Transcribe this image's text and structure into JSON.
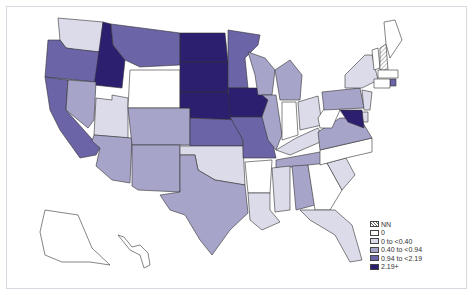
{
  "map": {
    "title": "",
    "colors": {
      "NN": "#ffffff",
      "zero": "#ffffff",
      "c1": "#dcdbe9",
      "c2": "#a7a4c9",
      "c3": "#6b64a6",
      "c4": "#2d1f70"
    },
    "legend": [
      {
        "key": "NN",
        "label": "NN",
        "color": "#ffffff",
        "hatched": true
      },
      {
        "key": "zero",
        "label": "0",
        "color": "#ffffff"
      },
      {
        "key": "c1",
        "label": "0 to <0.40",
        "color": "#dcdbe9"
      },
      {
        "key": "c2",
        "label": "0.40 to <0.94",
        "color": "#a7a4c9"
      },
      {
        "key": "c3",
        "label": "0.94 to <2.19",
        "color": "#6b64a6"
      },
      {
        "key": "c4",
        "label": "2.19+",
        "color": "#2d1f70"
      }
    ],
    "states": {
      "WA": "c1",
      "OR": "c3",
      "CA": "c3",
      "ID": "c4",
      "NV": "c2",
      "UT": "c1",
      "AZ": "c2",
      "MT": "c3",
      "WY": "zero",
      "CO": "c2",
      "NM": "c2",
      "ND": "c4",
      "SD": "c4",
      "NE": "c4",
      "KS": "c3",
      "OK": "c1",
      "TX": "c2",
      "MN": "c3",
      "IA": "c4",
      "MO": "c3",
      "AR": "zero",
      "LA": "c1",
      "WI": "c2",
      "IL": "c2",
      "MI": "c2",
      "IN": "zero",
      "OH": "c1",
      "KY": "c1",
      "TN": "c2",
      "MS": "c1",
      "AL": "c2",
      "GA": "zero",
      "FL": "c1",
      "SC": "c1",
      "NC": "zero",
      "VA": "c2",
      "WV": "zero",
      "PA": "c2",
      "NY": "c1",
      "VT": "zero",
      "NH": "NN",
      "ME": "zero",
      "MA": "zero",
      "RI": "c3",
      "CT": "zero",
      "NJ": "c1",
      "DE": "c1",
      "MD": "c4",
      "AK": "zero",
      "HI": "zero"
    }
  }
}
